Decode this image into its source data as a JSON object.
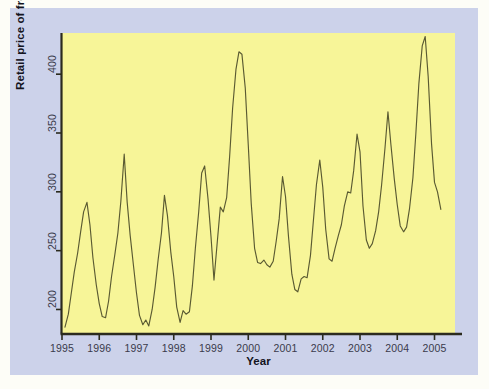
{
  "figure": {
    "background_color": "#ccd2ea",
    "panel_color": "#f7f598",
    "line_color": "#5a5a32",
    "axis_color": "#2b2b1e",
    "outer_margin_color": "#fdfdf7"
  },
  "chart_data": {
    "type": "line",
    "title": "",
    "xlabel": "Year",
    "ylabel": "Retail price of fresh oranges",
    "xlim": [
      1995.0,
      2005.55
    ],
    "ylim": [
      180,
      435
    ],
    "xticks": [
      1995,
      1996,
      1997,
      1998,
      1999,
      2000,
      2001,
      2002,
      2003,
      2004,
      2005
    ],
    "xticklabels": [
      "1995",
      "1996",
      "1997",
      "1998",
      "1999",
      "2000",
      "2001",
      "2002",
      "2003",
      "2004",
      "2005"
    ],
    "yticks": [
      200,
      250,
      300,
      350,
      400
    ],
    "yticklabels": [
      "200",
      "250",
      "300",
      "350",
      "400"
    ],
    "grid": false,
    "legend": false,
    "series": [
      {
        "name": "Retail price of fresh oranges",
        "x": [
          1995.08,
          1995.17,
          1995.25,
          1995.33,
          1995.42,
          1995.5,
          1995.58,
          1995.67,
          1995.75,
          1995.83,
          1995.92,
          1996.0,
          1996.08,
          1996.17,
          1996.25,
          1996.33,
          1996.42,
          1996.5,
          1996.58,
          1996.67,
          1996.75,
          1996.83,
          1996.92,
          1997.0,
          1997.08,
          1997.17,
          1997.25,
          1997.33,
          1997.42,
          1997.5,
          1997.58,
          1997.67,
          1997.75,
          1997.83,
          1997.92,
          1998.0,
          1998.08,
          1998.17,
          1998.25,
          1998.33,
          1998.42,
          1998.5,
          1998.58,
          1998.67,
          1998.75,
          1998.83,
          1998.92,
          1999.0,
          1999.08,
          1999.17,
          1999.25,
          1999.33,
          1999.42,
          1999.5,
          1999.58,
          1999.67,
          1999.75,
          1999.83,
          1999.92,
          2000.0,
          2000.08,
          2000.17,
          2000.25,
          2000.33,
          2000.42,
          2000.5,
          2000.58,
          2000.67,
          2000.75,
          2000.83,
          2000.92,
          2001.0,
          2001.08,
          2001.17,
          2001.25,
          2001.33,
          2001.42,
          2001.5,
          2001.58,
          2001.67,
          2001.75,
          2001.83,
          2001.92,
          2002.0,
          2002.08,
          2002.17,
          2002.25,
          2002.33,
          2002.42,
          2002.5,
          2002.58,
          2002.67,
          2002.75,
          2002.83,
          2002.92,
          2003.0,
          2003.08,
          2003.17,
          2003.25,
          2003.33,
          2003.42,
          2003.5,
          2003.58,
          2003.67,
          2003.75,
          2003.83,
          2003.92,
          2004.0,
          2004.08,
          2004.17,
          2004.25,
          2004.33,
          2004.42,
          2004.5,
          2004.58,
          2004.67,
          2004.75,
          2004.83,
          2004.92,
          2005.0,
          2005.08,
          2005.17
        ],
        "y": [
          185,
          196,
          214,
          232,
          248,
          266,
          283,
          291,
          272,
          244,
          221,
          205,
          194,
          193,
          207,
          228,
          247,
          265,
          292,
          332,
          291,
          263,
          237,
          214,
          195,
          187,
          191,
          186,
          200,
          219,
          242,
          265,
          297,
          280,
          249,
          228,
          202,
          189,
          199,
          196,
          198,
          220,
          252,
          283,
          316,
          322,
          294,
          262,
          225,
          258,
          287,
          283,
          295,
          330,
          371,
          404,
          419,
          417,
          388,
          340,
          290,
          252,
          240,
          239,
          242,
          238,
          236,
          241,
          258,
          277,
          313,
          296,
          262,
          230,
          217,
          215,
          226,
          228,
          227,
          246,
          276,
          306,
          327,
          304,
          268,
          243,
          241,
          252,
          263,
          272,
          288,
          300,
          299,
          318,
          349,
          334,
          288,
          259,
          252,
          256,
          267,
          283,
          306,
          337,
          368,
          340,
          311,
          289,
          271,
          266,
          270,
          286,
          312,
          350,
          392,
          424,
          432,
          398,
          341,
          308,
          300,
          285
        ]
      }
    ]
  }
}
